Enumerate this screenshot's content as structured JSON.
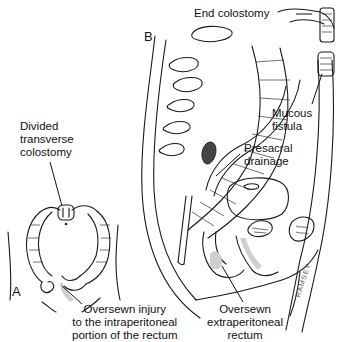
{
  "figure": {
    "panels": [
      {
        "letter": "A",
        "labels": {
          "divided_colostomy": [
            "Divided",
            "transverse",
            "colostomy"
          ],
          "oversewn_injury": [
            "Oversewn injury",
            "to the intraperitoneal",
            "portion of the rectum"
          ]
        }
      },
      {
        "letter": "B",
        "labels": {
          "end_colostomy": "End colostomy",
          "mucous_fistula": [
            "Mucous",
            "fistula"
          ],
          "presacral_drainage": [
            "Presacral",
            "drainage"
          ],
          "oversewn_extraperitoneal": [
            "Oversewn",
            "extraperitoneal",
            "rectum"
          ]
        }
      }
    ],
    "signature": "RAMSEY"
  }
}
